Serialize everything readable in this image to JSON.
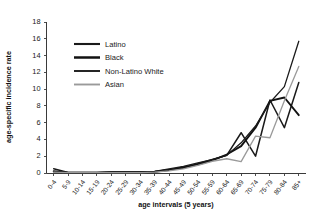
{
  "chart_data": {
    "type": "line",
    "title": "",
    "xlabel": "age intervals (5 years)",
    "ylabel": "age-specific incidence rate",
    "ylim": [
      0,
      18
    ],
    "yticks": [
      0,
      2,
      4,
      6,
      8,
      10,
      12,
      14,
      16,
      18
    ],
    "grid": false,
    "legend_position": "upper-left-inside",
    "categories": [
      "0-4",
      "5-9",
      "10-14",
      "15-19",
      "20-24",
      "25-29",
      "30-34",
      "35-39",
      "40-44",
      "45-49",
      "50-54",
      "55-59",
      "60-64",
      "65-69",
      "70-74",
      "75-79",
      "80-84",
      "85+"
    ],
    "series": [
      {
        "name": "Latino",
        "color": "#1a1a1a",
        "width": 1.5,
        "values": [
          0.5,
          0.05,
          0.05,
          0.05,
          0.1,
          0.1,
          0.1,
          0.15,
          0.4,
          0.6,
          1.1,
          1.6,
          2.1,
          4.8,
          2.0,
          8.7,
          5.4,
          10.8
        ]
      },
      {
        "name": "Black",
        "color": "#121212",
        "width": 1.9,
        "values": [
          0.2,
          0.05,
          0.05,
          0.05,
          0.1,
          0.1,
          0.1,
          0.15,
          0.35,
          0.7,
          1.0,
          1.5,
          2.2,
          3.2,
          5.4,
          8.6,
          9.0,
          6.9
        ]
      },
      {
        "name": "Non-Latino White",
        "color": "#1a1a1a",
        "width": 1.3,
        "values": [
          0.15,
          0.05,
          0.05,
          0.05,
          0.1,
          0.1,
          0.1,
          0.2,
          0.5,
          0.8,
          1.2,
          1.6,
          2.1,
          3.6,
          5.6,
          8.4,
          10.3,
          15.7
        ]
      },
      {
        "name": "Asian",
        "color": "#9a9a9a",
        "width": 1.3,
        "values": [
          0.1,
          0.05,
          0.05,
          0.05,
          0.05,
          0.05,
          0.05,
          0.1,
          0.25,
          0.5,
          0.9,
          1.4,
          1.7,
          1.35,
          4.4,
          4.2,
          8.6,
          12.7
        ]
      }
    ]
  },
  "legend": {
    "items": [
      {
        "label": "Latino"
      },
      {
        "label": "Black"
      },
      {
        "label": "Non-Latino White"
      },
      {
        "label": "Asian"
      }
    ]
  }
}
